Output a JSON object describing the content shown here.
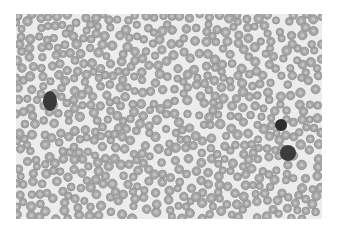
{
  "image": {
    "description": "Blood smear micrograph with red blood cells and three dark-stained white blood cells",
    "frame": {
      "x": 16,
      "y": 14,
      "width": 306,
      "height": 205
    },
    "background_color": "#ececec",
    "page_color": "#ffffff"
  },
  "cells": {
    "rbc": {
      "count_estimate": 650,
      "radius_range": [
        3.6,
        4.8
      ],
      "fill_color": "#a6a6a6",
      "center_color": "#c4c4c4",
      "edge_color": "#8e8e8e",
      "seed": 7
    },
    "wbc": [
      {
        "x": 34,
        "y": 87,
        "rx": 7,
        "ry": 10,
        "color": "#3a3a3a",
        "label": "leukocyte-left"
      },
      {
        "x": 265,
        "y": 111,
        "rx": 6,
        "ry": 6,
        "color": "#2e2e2e",
        "label": "leukocyte-right-upper"
      },
      {
        "x": 272,
        "y": 139,
        "rx": 8,
        "ry": 8,
        "color": "#3c3c3c",
        "label": "leukocyte-right-lower"
      }
    ]
  }
}
